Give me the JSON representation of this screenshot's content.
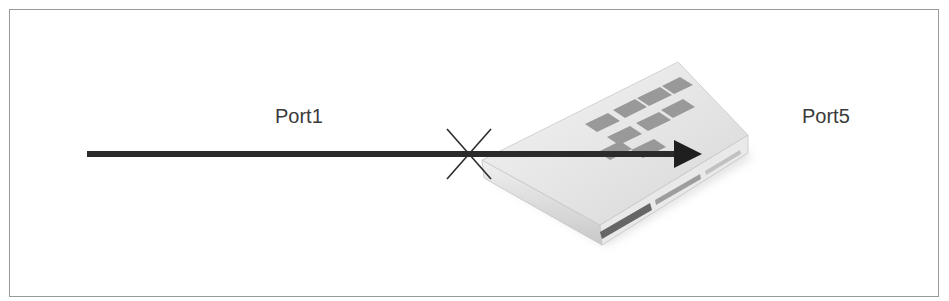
{
  "diagram": {
    "labels": {
      "port1": "Port1",
      "port5": "Port5"
    },
    "nodes": [
      {
        "id": "firewall-device",
        "type": "firewall appliance",
        "icon": "firewall-appliance-icon"
      }
    ],
    "edges": [
      {
        "from": "Port1",
        "to": "Port5",
        "style": "thick arrow",
        "blocked_marker": "x-mark"
      }
    ],
    "colors": {
      "frame_border": "#9a9a9a",
      "arrow": "#2b2b2b",
      "text": "#3a3a3a",
      "device_body": "#e6e6e6",
      "device_logo": "#8c8c8c"
    }
  }
}
